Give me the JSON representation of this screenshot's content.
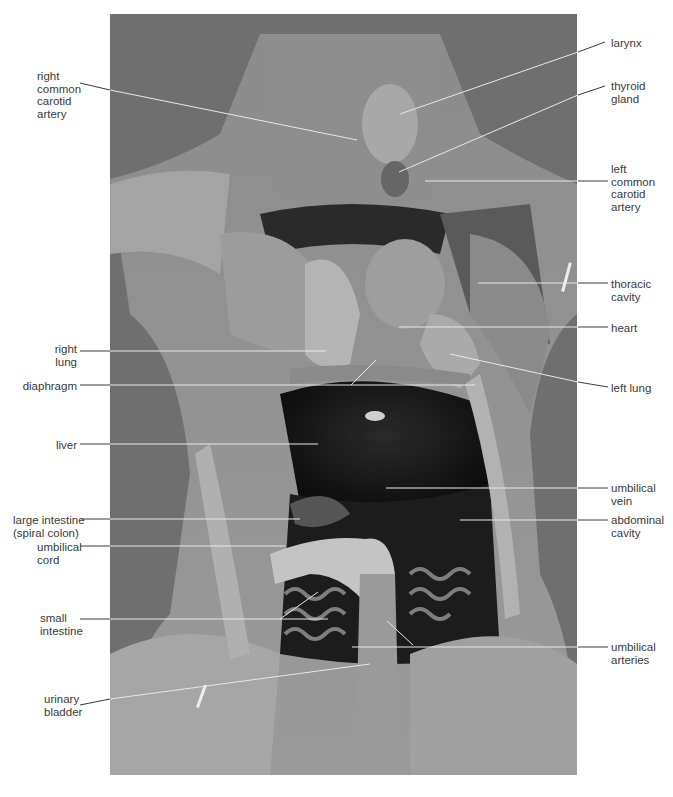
{
  "figure": {
    "palette": {
      "background": "#ffffff",
      "photo_base": "#7a7a7a",
      "label_text": "#3a3a3a",
      "leader_on_white": "#3a3a3a",
      "leader_on_photo": "#e8e8e8"
    }
  },
  "labels": {
    "left": [
      {
        "id": "right-common-carotid-artery",
        "text": "right\ncommon\ncarotid\nartery"
      },
      {
        "id": "right-lung",
        "text": "right\nlung"
      },
      {
        "id": "diaphragm",
        "text": "diaphragm"
      },
      {
        "id": "liver",
        "text": "liver"
      },
      {
        "id": "large-intestine",
        "text": "large intestine\n(spiral colon)"
      },
      {
        "id": "umbilical-cord",
        "text": "umbilical\ncord"
      },
      {
        "id": "small-intestine",
        "text": "small\nintestine"
      },
      {
        "id": "urinary-bladder",
        "text": "urinary\nbladder"
      }
    ],
    "right": [
      {
        "id": "larynx",
        "text": "larynx"
      },
      {
        "id": "thyroid-gland",
        "text": "thyroid\ngland"
      },
      {
        "id": "left-common-carotid-artery",
        "text": "left\ncommon\ncarotid\nartery"
      },
      {
        "id": "thoracic-cavity",
        "text": "thoracic\ncavity"
      },
      {
        "id": "heart",
        "text": "heart"
      },
      {
        "id": "left-lung",
        "text": "left lung"
      },
      {
        "id": "umbilical-vein",
        "text": "umbilical\nvein"
      },
      {
        "id": "abdominal-cavity",
        "text": "abdominal\ncavity"
      },
      {
        "id": "umbilical-arteries",
        "text": "umbilical\narteries"
      }
    ]
  }
}
